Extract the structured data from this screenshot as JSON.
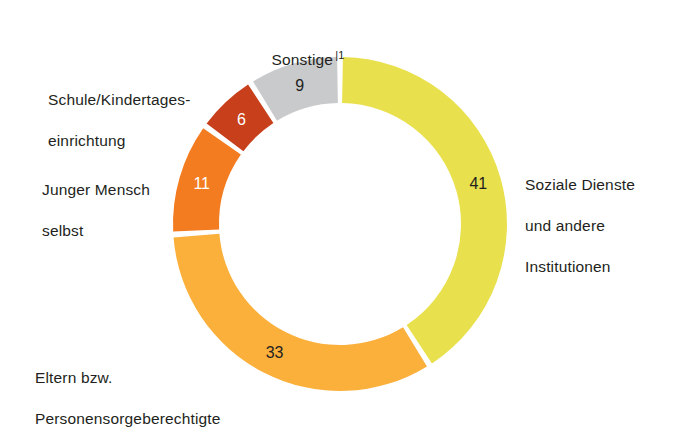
{
  "chart_data": {
    "type": "pie",
    "title": "",
    "subtitle": "",
    "xlabel": "",
    "ylabel": "",
    "legend_position": "callout-labels",
    "grid": false,
    "donut": true,
    "inner_radius_ratio": 0.72,
    "start_angle_deg": 0,
    "direction": "clockwise",
    "categories": [
      "Soziale Dienste und andere Institutionen",
      "Eltern bzw. Personensorgeberechtigte",
      "Junger Mensch selbst",
      "Schule/Kindertageseinrichtung",
      "Sonstige"
    ],
    "values": [
      41,
      33,
      11,
      6,
      9
    ],
    "value_labels": [
      "41",
      "33",
      "11",
      "6",
      "9"
    ],
    "colors": [
      "#e9e04e",
      "#fbb03b",
      "#f47c20",
      "#c8401b",
      "#c9cacb"
    ],
    "value_label_colors": [
      "#231f20",
      "#231f20",
      "#ffffff",
      "#ffffff",
      "#231f20"
    ],
    "annotations": [
      "1"
    ],
    "unit": "percent"
  },
  "labels": {
    "sonstige": {
      "text": "Sonstige",
      "footnote": "|1",
      "value": "9"
    },
    "schule": {
      "line1": "Schule/Kindertages-",
      "line2": "einrichtung",
      "value": "6"
    },
    "junger": {
      "line1": "Junger Mensch",
      "line2": "selbst",
      "value": "11"
    },
    "eltern": {
      "line1": "Eltern bzw.",
      "line2": "Personensorgeberechtigte",
      "value": "33"
    },
    "soziale": {
      "line1": "Soziale Dienste",
      "line2": "und andere",
      "line3": "Institutionen",
      "value": "41"
    }
  },
  "geometry": {
    "center_x": 340,
    "center_y": 224,
    "outer_radius": 167,
    "inner_radius": 121,
    "gap_deg": 2.0
  }
}
